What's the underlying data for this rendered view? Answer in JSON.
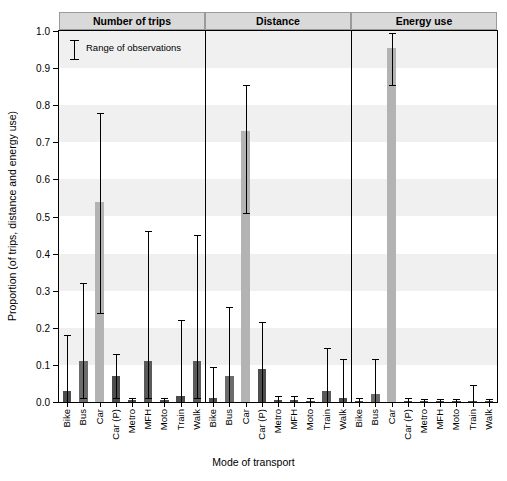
{
  "chart_data": {
    "type": "bar",
    "title": "",
    "xlabel": "Mode of transport",
    "ylabel": "Proportion (of trips, distance and energy use)",
    "ylim": [
      0,
      1.0
    ],
    "ytick_labels": [
      "0.0",
      "0.1",
      "0.2",
      "0.3",
      "0.4",
      "0.5",
      "0.6",
      "0.7",
      "0.8",
      "0.9",
      "1.0"
    ],
    "ytick_values": [
      0.0,
      0.1,
      0.2,
      0.3,
      0.4,
      0.5,
      0.6,
      0.7,
      0.8,
      0.9,
      1.0
    ],
    "grid": "horizontal banding",
    "legend": {
      "position": "top-left inside plot",
      "entries": [
        "Range of observations"
      ]
    },
    "panels": [
      {
        "label": "Number of trips",
        "categories": [
          "Bike",
          "Bus",
          "Car",
          "Car (P)",
          "Metro",
          "MFH",
          "Moto",
          "Train",
          "Walk"
        ],
        "values": [
          0.03,
          0.11,
          0.54,
          0.07,
          0.005,
          0.11,
          0.005,
          0.015,
          0.11
        ],
        "err_low": [
          0.0,
          0.01,
          0.24,
          0.01,
          0.0,
          0.01,
          0.0,
          0.0,
          0.01
        ],
        "err_high": [
          0.18,
          0.32,
          0.78,
          0.13,
          0.01,
          0.46,
          0.01,
          0.22,
          0.45
        ],
        "colors": [
          "#4d4d4d",
          "#6b6b6b",
          "#b3b3b3",
          "#4d4d4d",
          "#4d4d4d",
          "#5a5a5a",
          "#4d4d4d",
          "#4d4d4d",
          "#5a5a5a"
        ]
      },
      {
        "label": "Distance",
        "categories": [
          "Bike",
          "Bus",
          "Car",
          "Car (P)",
          "Metro",
          "MFH",
          "Moto",
          "Train",
          "Walk"
        ],
        "values": [
          0.012,
          0.07,
          0.73,
          0.09,
          0.005,
          0.005,
          0.003,
          0.03,
          0.012
        ],
        "err_low": [
          0.0,
          0.0,
          0.51,
          0.0,
          0.0,
          0.0,
          0.0,
          0.0,
          0.0
        ],
        "err_high": [
          0.095,
          0.255,
          0.855,
          0.215,
          0.015,
          0.015,
          0.01,
          0.145,
          0.115
        ],
        "colors": [
          "#4d4d4d",
          "#6b6b6b",
          "#b3b3b3",
          "#4d4d4d",
          "#4d4d4d",
          "#4d4d4d",
          "#4d4d4d",
          "#5a5a5a",
          "#4d4d4d"
        ]
      },
      {
        "label": "Energy use",
        "categories": [
          "Bike",
          "Bus",
          "Car",
          "Car (P)",
          "Metro",
          "MFH",
          "Moto",
          "Train",
          "Walk"
        ],
        "values": [
          0.003,
          0.022,
          0.955,
          0.003,
          0.002,
          0.002,
          0.002,
          0.002,
          0.002
        ],
        "err_low": [
          0.0,
          0.0,
          0.855,
          0.0,
          0.0,
          0.0,
          0.0,
          0.0,
          0.0
        ],
        "err_high": [
          0.012,
          0.115,
          0.995,
          0.012,
          0.008,
          0.008,
          0.008,
          0.045,
          0.008
        ],
        "colors": [
          "#4d4d4d",
          "#6b6b6b",
          "#b3b3b3",
          "#4d4d4d",
          "#4d4d4d",
          "#4d4d4d",
          "#4d4d4d",
          "#4d4d4d",
          "#4d4d4d"
        ]
      }
    ]
  }
}
